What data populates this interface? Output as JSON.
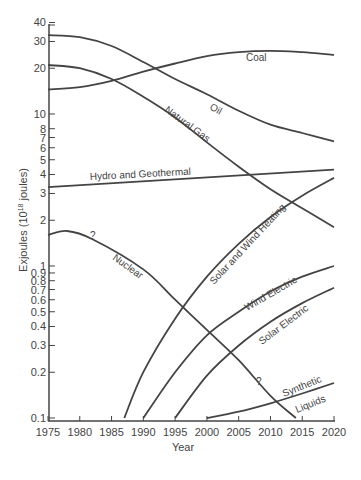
{
  "chart_data": {
    "type": "line",
    "title": "",
    "xlabel": "Year",
    "ylabel": "Exjoules (10^18 joules)",
    "ylabel_main": "Exjoules (10",
    "ylabel_sup": "18",
    "ylabel_tail": " joules)",
    "yscale": "log",
    "xlim": [
      1975,
      2020
    ],
    "ylim": [
      0.1,
      40
    ],
    "grid": false,
    "legend": "inline labels",
    "x_ticks": [
      1975,
      1980,
      1985,
      1990,
      1995,
      2000,
      2005,
      2010,
      2015,
      2020
    ],
    "y_ticks": [
      0.1,
      0.2,
      0.3,
      0.4,
      0.5,
      0.6,
      0.7,
      0.8,
      0.9,
      1,
      2,
      3,
      4,
      5,
      6,
      7,
      8,
      10,
      20,
      30,
      40
    ],
    "y_tick_labels": [
      "0.1",
      "0.2",
      "0.3",
      "0.4",
      "0.5",
      "0.6",
      "0.7",
      "0.8",
      "0.9",
      "1",
      "2",
      "3",
      "4",
      "5",
      "6",
      "7",
      "8",
      "10",
      "20",
      "30",
      "40"
    ],
    "series": [
      {
        "name": "Coal",
        "x": [
          1975,
          1980,
          1985,
          1990,
          1995,
          2000,
          2005,
          2010,
          2015,
          2020
        ],
        "values": [
          14.5,
          15,
          16.5,
          19,
          21.5,
          24,
          25.5,
          26,
          25.5,
          24.5
        ]
      },
      {
        "name": "Oil",
        "x": [
          1975,
          1980,
          1985,
          1990,
          1995,
          2000,
          2005,
          2010,
          2015,
          2020
        ],
        "values": [
          33,
          32,
          28,
          22,
          17,
          13.5,
          10.5,
          8.5,
          7.5,
          6.6
        ]
      },
      {
        "name": "Natural Gas",
        "x": [
          1975,
          1980,
          1985,
          1990,
          1995,
          2000,
          2005,
          2010,
          2015,
          2020
        ],
        "values": [
          21,
          20,
          17,
          13,
          9.5,
          6.5,
          4.5,
          3.2,
          2.4,
          1.8
        ]
      },
      {
        "name": "Hydro and Geothermal",
        "x": [
          1975,
          2020
        ],
        "values": [
          3.3,
          4.3
        ]
      },
      {
        "name": "Nuclear",
        "x": [
          1975,
          1978,
          1982,
          1990,
          1995,
          2000,
          2005,
          2010,
          2014
        ],
        "values": [
          1.6,
          1.7,
          1.5,
          0.95,
          0.6,
          0.38,
          0.24,
          0.14,
          0.1
        ],
        "annotations": [
          "?",
          "?"
        ]
      },
      {
        "name": "Solar and Wind Heating",
        "x": [
          1987,
          1990,
          1995,
          2000,
          2005,
          2010,
          2015,
          2020
        ],
        "values": [
          0.1,
          0.2,
          0.45,
          0.85,
          1.4,
          2.1,
          2.9,
          3.8
        ]
      },
      {
        "name": "Wind Electric",
        "x": [
          1990,
          1995,
          2000,
          2005,
          2010,
          2015,
          2020
        ],
        "values": [
          0.1,
          0.2,
          0.35,
          0.5,
          0.68,
          0.85,
          1.0
        ]
      },
      {
        "name": "Solar Electric",
        "x": [
          1995,
          2000,
          2005,
          2010,
          2015,
          2020
        ],
        "values": [
          0.1,
          0.19,
          0.3,
          0.43,
          0.57,
          0.72
        ]
      },
      {
        "name": "Synthetic Liquids",
        "x": [
          2000,
          2005,
          2010,
          2015,
          2020
        ],
        "values": [
          0.1,
          0.11,
          0.125,
          0.145,
          0.17
        ]
      }
    ],
    "labels": {
      "coal": "Coal",
      "oil": "Oil",
      "natural_gas": "Natural Gas",
      "hydro": "Hydro and Geothermal",
      "nuclear": "Nuclear",
      "solar_wind_heating": "Solar and Wind Heating",
      "wind_electric": "Wind Electric",
      "solar_electric": "Solar Electric",
      "synthetic": "Synthetic",
      "liquids": "Liquids",
      "question": "?"
    },
    "colors": {
      "line": "#444444",
      "axis": "#444444",
      "background": "#ffffff"
    }
  }
}
